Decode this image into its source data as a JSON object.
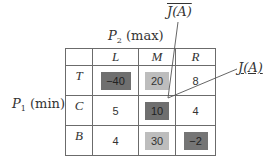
{
  "labels": {
    "column_player": "P",
    "column_player_sub": "2",
    "column_player_role": "(max)",
    "row_player": "P",
    "row_player_sub": "1",
    "row_player_role": "(min)",
    "upper_value": "J(A)",
    "lower_value": "J(A)"
  },
  "table": {
    "columns": [
      "L",
      "M",
      "R"
    ],
    "rows": [
      {
        "label": "T",
        "values": [
          "−40",
          "20",
          "8"
        ],
        "shading": [
          "dark",
          "light",
          "none"
        ]
      },
      {
        "label": "C",
        "values": [
          "5",
          "10",
          "4"
        ],
        "shading": [
          "none",
          "dark",
          "none"
        ]
      },
      {
        "label": "B",
        "values": [
          "4",
          "30",
          "−2"
        ],
        "shading": [
          "none",
          "light",
          "dark"
        ]
      }
    ]
  },
  "colors": {
    "dark_cell": "#6f6f6f",
    "light_cell": "#bdbdbd",
    "border": "#6b6b6b",
    "pointer_line": "#555555"
  }
}
